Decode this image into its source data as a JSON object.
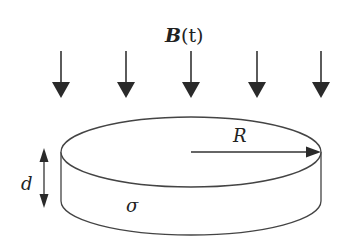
{
  "diagram": {
    "field_label_symbol": "B",
    "field_label_arg": "(t)",
    "field_arrow_count": 5,
    "radius_label": "R",
    "thickness_label": "d",
    "conductivity_label": "σ",
    "colors": {
      "stroke": "#333333",
      "arrow_fill": "#2a2a2a",
      "background": "#ffffff"
    }
  }
}
